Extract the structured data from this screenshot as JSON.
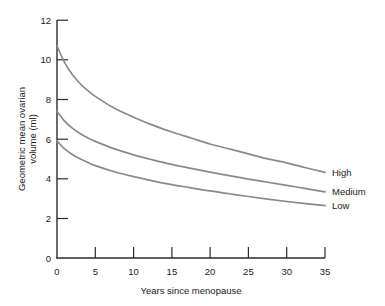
{
  "chart_data": {
    "type": "line",
    "title": "",
    "xlabel": "Years since menopause",
    "ylabel": "Geometric mean ovarian volume (ml)",
    "ylabel_line1": "Geometric mean ovarian",
    "ylabel_line2": "volume (ml)",
    "xlim": [
      0,
      35
    ],
    "ylim": [
      0,
      12
    ],
    "xticks": [
      0,
      5,
      10,
      15,
      20,
      25,
      30,
      35
    ],
    "yticks": [
      0,
      2,
      4,
      6,
      8,
      10,
      12
    ],
    "xtick_labels": [
      "0",
      "5",
      "10",
      "15",
      "20",
      "25",
      "30",
      "35"
    ],
    "ytick_labels": [
      "0",
      "2",
      "4",
      "6",
      "8",
      "10",
      "12"
    ],
    "grid": false,
    "legend_position": "right-of-curve-ends",
    "x": [
      0,
      1,
      2,
      3,
      4,
      5,
      7.5,
      10,
      12.5,
      15,
      17.5,
      20,
      22.5,
      25,
      27.5,
      30,
      32.5,
      35
    ],
    "series": [
      {
        "name": "High",
        "color": "#8a8a8a",
        "label": "High",
        "values": [
          10.7,
          9.85,
          9.25,
          8.8,
          8.45,
          8.15,
          7.55,
          7.1,
          6.7,
          6.35,
          6.05,
          5.75,
          5.5,
          5.25,
          5.0,
          4.8,
          4.55,
          4.32
        ]
      },
      {
        "name": "Medium",
        "color": "#8a8a8a",
        "label": "Medium",
        "values": [
          7.4,
          6.9,
          6.55,
          6.28,
          6.06,
          5.88,
          5.5,
          5.2,
          4.95,
          4.72,
          4.52,
          4.33,
          4.15,
          3.98,
          3.82,
          3.66,
          3.5,
          3.33
        ]
      },
      {
        "name": "Low",
        "color": "#8a8a8a",
        "label": "Low",
        "values": [
          5.9,
          5.5,
          5.22,
          5.0,
          4.82,
          4.66,
          4.35,
          4.1,
          3.89,
          3.7,
          3.54,
          3.38,
          3.24,
          3.1,
          2.97,
          2.85,
          2.74,
          2.64
        ]
      }
    ],
    "axis_color": "#2b2b2b",
    "curve_color": "#8a8a8a",
    "background": "#ffffff"
  }
}
